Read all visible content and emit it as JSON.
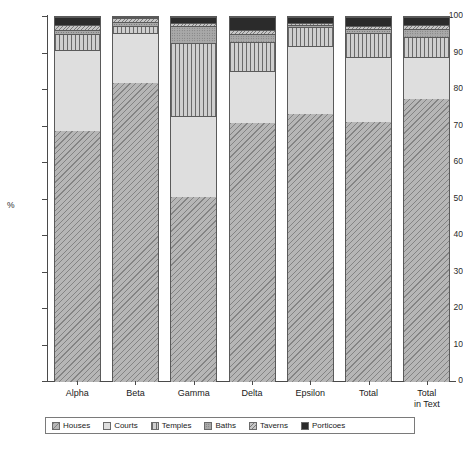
{
  "chart_data": {
    "type": "bar",
    "subtype": "stacked-percentage",
    "title": "",
    "subtitle": "",
    "xlabel": "",
    "ylabel": "%",
    "ylim": [
      0,
      100
    ],
    "ytick_labels": [
      "0",
      "10",
      "20",
      "30",
      "40",
      "50",
      "60",
      "70",
      "80",
      "90",
      "100"
    ],
    "ytick_values": [
      0,
      10,
      20,
      30,
      40,
      50,
      60,
      70,
      80,
      90,
      100
    ],
    "grid": false,
    "legend_position": "bottom",
    "categories": [
      "Alpha",
      "Beta",
      "Gamma",
      "Delta",
      "Epsilon",
      "Total",
      "Total\nin Text"
    ],
    "series": [
      {
        "name": "Houses",
        "pattern": "diagonal-hatch",
        "color": "#b6b6b6",
        "values": [
          68.8,
          81.9,
          50.6,
          71.0,
          73.5,
          71.1,
          77.5
        ]
      },
      {
        "name": "Courts",
        "pattern": "fine-dots",
        "color": "#dedede",
        "values": [
          22.1,
          13.6,
          22.4,
          14.1,
          18.5,
          18.0,
          11.6
        ]
      },
      {
        "name": "Temples",
        "pattern": "vertical-lines",
        "color": "#cfcfcf",
        "values": [
          4.4,
          2.0,
          19.9,
          8.0,
          5.3,
          6.4,
          5.5
        ]
      },
      {
        "name": "Baths",
        "pattern": "medium-dots",
        "color": "#a9a9a9",
        "values": [
          1.1,
          1.2,
          4.6,
          2.2,
          0.6,
          1.3,
          2.2
        ]
      },
      {
        "name": "Taverns",
        "pattern": "dense-hatch",
        "color": "#c6c6c6",
        "values": [
          1.5,
          0.9,
          0.8,
          1.1,
          0.4,
          0.7,
          1.0
        ]
      },
      {
        "name": "Porticoes",
        "pattern": "solid-black",
        "color": "#2b2b2b",
        "values": [
          2.1,
          0.4,
          1.7,
          3.6,
          1.7,
          2.5,
          2.2
        ]
      }
    ]
  },
  "axis": {
    "y_unit_label": "%"
  },
  "legend": {
    "items": [
      {
        "label": "Houses"
      },
      {
        "label": "Courts"
      },
      {
        "label": "Temples"
      },
      {
        "label": "Baths"
      },
      {
        "label": "Taverns"
      },
      {
        "label": "Porticoes"
      }
    ]
  }
}
